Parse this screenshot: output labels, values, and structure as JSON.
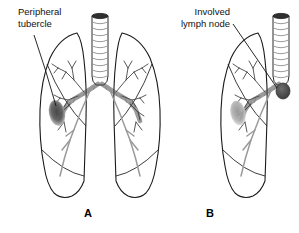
{
  "figure": {
    "background": "#ffffff",
    "annotations": {
      "peripheral_tubercle": "Peripheral\ntubercle",
      "involved_lymph_node": "Involved\nlymph node"
    },
    "panels": [
      {
        "id": "A",
        "letter": "A",
        "description": "Both lungs with peripheral tubercle in upper left lung"
      },
      {
        "id": "B",
        "letter": "B",
        "description": "Right lung with faint peripheral tubercle and involved hilar lymph node"
      }
    ],
    "colors": {
      "outline": "#1a1a1a",
      "airway": "#555555",
      "cartilage": "#8a8a8a",
      "tubercle_dark": "#555555",
      "tubercle_light": "#9a9a9a",
      "lymph_node": "#5a5a5a",
      "trachea_cap": "#2a2a2a",
      "vessel": "#888888"
    }
  }
}
